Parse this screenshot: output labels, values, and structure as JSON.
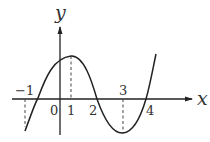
{
  "diagram": {
    "type": "function-graph",
    "axes": {
      "x_label": "x",
      "y_label": "y",
      "origin_label": "0"
    },
    "tick_labels": {
      "neg_one": "−1",
      "one": "1",
      "two": "2",
      "three": "3",
      "four": "4"
    },
    "curve": {
      "description": "cubic curve with local maximum at x=1 and local minimum at x=3, crossing x-axis between -1 and 0, at 2 and at 4",
      "local_max_x": 1,
      "local_min_x": 3,
      "x_intercepts_approx": [
        -0.7,
        2,
        4
      ]
    },
    "dashed_guides_at_x": [
      -1,
      1,
      3
    ],
    "colors": {
      "stroke": "#222222",
      "background": "#ffffff"
    }
  }
}
